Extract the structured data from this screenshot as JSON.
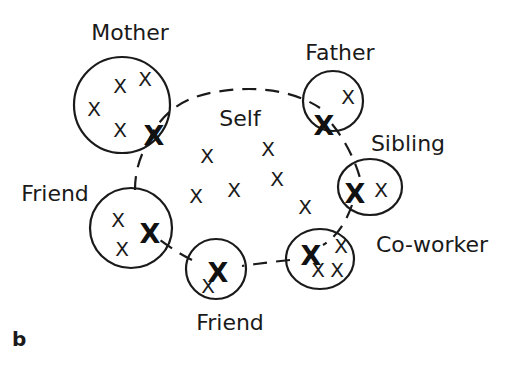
{
  "panel_label": "b",
  "self": {
    "label": "Self",
    "marks": [
      {
        "text": "X",
        "x": 207,
        "y": 163
      },
      {
        "text": "X",
        "x": 268,
        "y": 156
      },
      {
        "text": "X",
        "x": 234,
        "y": 197
      },
      {
        "text": "X",
        "x": 277,
        "y": 186
      },
      {
        "text": "X",
        "x": 196,
        "y": 203
      },
      {
        "text": "X",
        "x": 305,
        "y": 214
      }
    ]
  },
  "others": [
    {
      "id": "mother",
      "label": "Mother",
      "label_x": 130,
      "label_y": 40,
      "cx": 122,
      "cy": 105,
      "rx": 48,
      "ry": 48,
      "marks": [
        {
          "text": "X",
          "x": 120,
          "y": 93
        },
        {
          "text": "X",
          "x": 145,
          "y": 86
        },
        {
          "text": "X",
          "x": 94,
          "y": 116
        },
        {
          "text": "X",
          "x": 120,
          "y": 137
        }
      ],
      "shared": {
        "x": 154,
        "y": 135
      }
    },
    {
      "id": "father",
      "label": "Father",
      "label_x": 340,
      "label_y": 60,
      "cx": 333,
      "cy": 101,
      "rx": 30,
      "ry": 30,
      "marks": [
        {
          "text": "X",
          "x": 348,
          "y": 104
        }
      ],
      "shared": {
        "x": 324,
        "y": 125
      }
    },
    {
      "id": "sibling",
      "label": "Sibling",
      "label_x": 408,
      "label_y": 151,
      "cx": 370,
      "cy": 187,
      "rx": 32,
      "ry": 28,
      "marks": [
        {
          "text": "X",
          "x": 381,
          "y": 197
        }
      ],
      "shared": {
        "x": 355,
        "y": 193
      }
    },
    {
      "id": "coworker",
      "label": "Co-worker",
      "label_x": 432,
      "label_y": 252,
      "cx": 320,
      "cy": 259,
      "rx": 34,
      "ry": 30,
      "marks": [
        {
          "text": "X",
          "x": 341,
          "y": 253
        },
        {
          "text": "X",
          "x": 318,
          "y": 277
        },
        {
          "text": "X",
          "x": 337,
          "y": 277
        }
      ],
      "shared": {
        "x": 311,
        "y": 255
      }
    },
    {
      "id": "friend-bottom",
      "label": "Friend",
      "label_x": 230,
      "label_y": 330,
      "cx": 216,
      "cy": 269,
      "rx": 30,
      "ry": 30,
      "marks": [
        {
          "text": "X",
          "x": 208,
          "y": 293
        }
      ],
      "shared": {
        "x": 218,
        "y": 272
      }
    },
    {
      "id": "friend-left",
      "label": "Friend",
      "label_x": 55,
      "label_y": 201,
      "cx": 131,
      "cy": 228,
      "rx": 41,
      "ry": 40,
      "marks": [
        {
          "text": "X",
          "x": 118,
          "y": 227
        },
        {
          "text": "X",
          "x": 122,
          "y": 256
        }
      ],
      "shared": {
        "x": 150,
        "y": 233
      }
    }
  ]
}
